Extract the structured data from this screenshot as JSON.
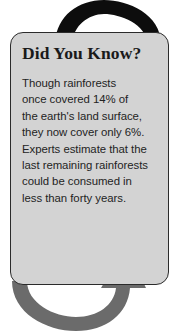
{
  "callout": {
    "title": "Did You Know?",
    "body_lines": [
      "Though rainforests",
      "once covered 14% of",
      "the earth's land surface,",
      "they now cover only 6%.",
      "Experts estimate that the",
      "last remaining rainforests",
      "could be consumed in",
      "less than forty years."
    ],
    "body_text": "Though rainforests once covered 14% of the earth's land surface, they now cover only 6%. Experts estimate that the last remaining rainforests could be consumed in less than forty years.",
    "facts": {
      "historic_land_coverage_percent": "14%",
      "current_land_coverage_percent": "6%",
      "time_to_consumption": "less than forty years"
    }
  },
  "decoration": {
    "top_arrow_name": "curved-arrow-down-icon",
    "bottom_arrow_name": "curved-arrow-up-icon"
  },
  "colors": {
    "card_background": "#d3d3d3",
    "card_border": "#2b2b2b",
    "page_background": "#ffffff",
    "title_text": "#1a1a1a",
    "body_text": "#232323",
    "top_arrow": "#0d0d0d",
    "bottom_arrow": "#6b6b6b"
  }
}
